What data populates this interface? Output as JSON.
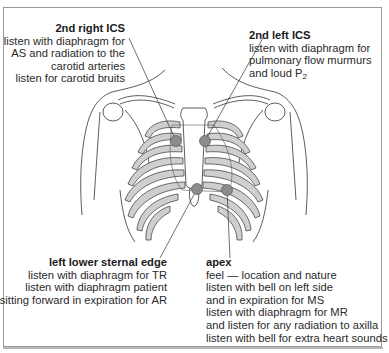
{
  "diagram": {
    "colors": {
      "frame_border": "#9a9a9a",
      "line": "#333333",
      "rib_fill": "#cfcfcf",
      "auscultation_point": "#8c8c8c",
      "text": "#2a2a2a"
    },
    "labels": {
      "second_right_ics": {
        "title": "2nd right ICS",
        "lines": [
          "listen with diaphragm for",
          "AS and radiation to the",
          "carotid arteries",
          "listen for carotid bruits"
        ]
      },
      "second_left_ics": {
        "title": "2nd left ICS",
        "lines": [
          "listen with diaphragm for",
          "pulmonary flow murmurs",
          "and loud P"
        ],
        "subscript": "2"
      },
      "left_lower_sternal_edge": {
        "title": "left lower sternal edge",
        "lines": [
          "listen with diaphragm for TR",
          "listen with diaphragm patient",
          "sitting forward in expiration for AR"
        ]
      },
      "apex": {
        "title": "apex",
        "lines": [
          "feel — location and nature",
          "listen with bell on left side",
          "and in expiration for MS",
          "listen with diaphragm for MR",
          "and listen for any radiation to axilla",
          "listen with bell for extra heart sounds"
        ]
      }
    },
    "points": [
      {
        "name": "2nd right ICS",
        "x": 176,
        "y": 141
      },
      {
        "name": "2nd left ICS",
        "x": 205,
        "y": 141
      },
      {
        "name": "left lower sternal edge",
        "x": 197,
        "y": 189
      },
      {
        "name": "apex",
        "x": 227,
        "y": 190
      }
    ]
  }
}
